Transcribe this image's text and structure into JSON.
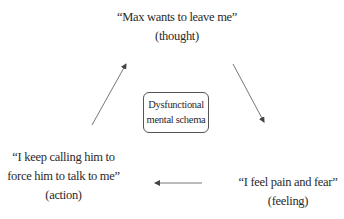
{
  "diagram": {
    "type": "cycle",
    "center": {
      "lines": [
        "Dysfunctional",
        "mental schema"
      ]
    },
    "nodes": {
      "thought": {
        "lines": [
          "“Max wants to leave me”",
          "(thought)"
        ]
      },
      "feeling": {
        "lines": [
          "“I feel pain and fear”",
          "(feeling)"
        ]
      },
      "action": {
        "lines": [
          "“I keep calling him to",
          "force him to talk to me”",
          "(action)"
        ]
      }
    },
    "edges": [
      {
        "from": "thought",
        "to": "feeling"
      },
      {
        "from": "feeling",
        "to": "action"
      },
      {
        "from": "action",
        "to": "thought"
      }
    ],
    "colors": {
      "text": "#2a2a2a",
      "line": "#555555",
      "background": "#ffffff"
    }
  }
}
